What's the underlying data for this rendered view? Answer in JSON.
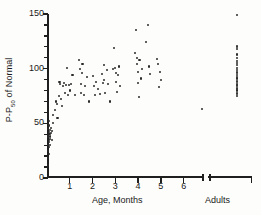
{
  "chart_data": {
    "type": "scatter",
    "title": "",
    "subtitle": "",
    "xlabel": "Age, Months",
    "ylabel_prefix": "P-P",
    "ylabel_sub": "50",
    "ylabel_suffix": " of Normal",
    "ylabel_full": "P-P50 of Normal",
    "group_label": "Adults",
    "grid": false,
    "legend": false,
    "xlim": [
      0,
      7.4
    ],
    "ylim": [
      0,
      150
    ],
    "yticks": [
      0,
      50,
      100,
      150
    ],
    "ytick_labels": [
      "0",
      "50",
      "100",
      "150"
    ],
    "ytick_minor": [
      10,
      20,
      30,
      40,
      60,
      70,
      80,
      90,
      110,
      120,
      130,
      140
    ],
    "xticks": [
      1,
      2,
      3,
      4,
      5,
      6
    ],
    "xtick_labels": [
      "1",
      "2",
      "3",
      "4",
      "5",
      "6"
    ],
    "axis_break_after": 6.85,
    "adults_x": 8.35,
    "series": [
      {
        "name": "Infants",
        "x": [
          0.03,
          0.04,
          0.05,
          0.05,
          0.06,
          0.06,
          0.07,
          0.07,
          0.08,
          0.08,
          0.09,
          0.1,
          0.1,
          0.11,
          0.12,
          0.13,
          0.14,
          0.15,
          0.17,
          0.18,
          0.2,
          0.22,
          0.25,
          0.28,
          0.34,
          0.38,
          0.42,
          0.46,
          0.52,
          0.55,
          0.58,
          0.62,
          0.66,
          0.7,
          0.74,
          0.78,
          0.82,
          0.88,
          0.94,
          0.97,
          1.02,
          1.06,
          1.12,
          1.22,
          1.42,
          1.46,
          1.48,
          1.5,
          1.52,
          1.56,
          1.62,
          1.68,
          1.74,
          1.86,
          2.02,
          2.06,
          2.1,
          2.14,
          2.22,
          2.34,
          2.42,
          2.46,
          2.5,
          2.52,
          2.56,
          2.62,
          2.68,
          2.76,
          2.88,
          2.96,
          3.0,
          3.02,
          3.04,
          3.06,
          3.1,
          3.16,
          3.22,
          3.86,
          3.9,
          3.94,
          3.96,
          3.98,
          4.0,
          4.02,
          4.06,
          4.12,
          4.18,
          4.34,
          4.42,
          4.46,
          4.52,
          4.82,
          4.86,
          4.92,
          4.96,
          5.02,
          6.82
        ],
        "y": [
          18,
          12,
          25,
          38,
          30,
          45,
          22,
          35,
          42,
          28,
          48,
          33,
          52,
          40,
          36,
          44,
          38,
          30,
          46,
          41,
          35,
          43,
          50,
          58,
          62,
          70,
          68,
          55,
          75,
          88,
          86,
          72,
          66,
          84,
          87,
          78,
          85,
          101,
          76,
          85,
          80,
          86,
          94,
          76,
          108,
          100,
          86,
          78,
          96,
          104,
          76,
          84,
          92,
          70,
          93,
          84,
          76,
          88,
          81,
          77,
          95,
          87,
          103,
          90,
          78,
          99,
          86,
          70,
          100,
          119,
          101,
          96,
          88,
          79,
          94,
          102,
          84,
          114,
          135,
          104,
          110,
          97,
          87,
          74,
          108,
          91,
          100,
          124,
          140,
          102,
          95,
          109,
          104,
          83,
          97,
          90,
          63
        ]
      },
      {
        "name": "Adults",
        "x": [
          8.33,
          8.35,
          8.34,
          8.35,
          8.36,
          8.33,
          8.35,
          8.34,
          8.36,
          8.35,
          8.34,
          8.35,
          8.33,
          8.35,
          8.36,
          8.34,
          8.35,
          8.33,
          8.35,
          8.34,
          8.36,
          8.35,
          8.34,
          8.35,
          8.33,
          8.35,
          8.34
        ],
        "y": [
          149,
          121,
          120,
          118,
          113,
          110,
          107,
          105,
          103,
          101,
          99,
          97,
          96,
          94,
          92,
          91,
          89,
          88,
          86,
          85,
          84,
          82,
          81,
          80,
          78,
          77,
          75
        ]
      }
    ]
  }
}
